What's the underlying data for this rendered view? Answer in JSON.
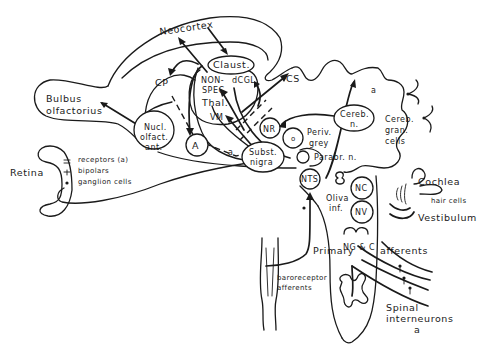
{
  "diagram": {
    "type": "neuroanatomical pathway diagram",
    "regions": {
      "neocortex": "Neocortex",
      "claustrum": "Claust.",
      "cp": "CP",
      "thalamus": [
        "NON-",
        "SPEC.",
        "Thal.",
        "VM"
      ],
      "dcgl": "dCGL",
      "bulbus": [
        "Bulbus",
        "olfactorius"
      ],
      "nucl_olfact": [
        "Nucl.",
        "olfact.",
        "ant."
      ],
      "amygdala": "A",
      "cs": "CS",
      "nr": "NR",
      "o": "o",
      "periv_grey": [
        "Periv.",
        "grey"
      ],
      "cereb_n": [
        "Cereb.",
        "n."
      ],
      "cereb_gran": [
        "Cereb.",
        "gran.",
        "cells"
      ],
      "a_upper": "a",
      "a_mid": "a",
      "subst_nigra": [
        "Subst.",
        "nigra"
      ],
      "parabr": "Parabr. n.",
      "nts": "NTS",
      "retina": "Retina",
      "retina_layers": [
        "receptors (a)",
        "bipolars",
        "ganglion cells"
      ],
      "oliva": [
        "Oliva",
        "inf."
      ],
      "nc": "NC",
      "nv": "NV",
      "cochlea": "Cochlea",
      "hair_cells": "hair cells",
      "vestibulum": "Vestibulum",
      "ngc": "NG & C",
      "primary": "Primary",
      "afferents": "afferents",
      "baroreceptor": [
        "baroreceptor",
        "afferents"
      ],
      "spinal": [
        "Spinal",
        "interneurons",
        "a"
      ]
    }
  }
}
